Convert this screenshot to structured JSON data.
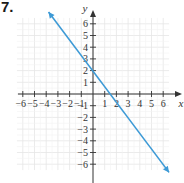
{
  "problem_number": "7.",
  "chart_data": {
    "type": "line",
    "title": "",
    "xlabel": "x",
    "ylabel": "y",
    "xlim": [
      -6,
      6
    ],
    "ylim": [
      -6,
      6
    ],
    "grid": true,
    "x_ticks": [
      -6,
      -5,
      -4,
      -3,
      -2,
      -1,
      1,
      2,
      3,
      4,
      5,
      6
    ],
    "y_ticks": [
      -6,
      -5,
      -4,
      -3,
      -2,
      -1,
      1,
      2,
      3,
      4,
      5,
      6
    ],
    "series": [
      {
        "name": "line",
        "equation": "y = -4/3 x + 2",
        "slope": -1.3333,
        "y_intercept": 2,
        "x_intercept": 1.5,
        "x": [
          -3.8,
          6.5
        ],
        "y": [
          7.0,
          -6.7
        ],
        "arrows_both_ends": true,
        "color": "#3d9ad6"
      }
    ]
  },
  "colors": {
    "grid": "#e6e6e6",
    "axis": "#333333",
    "line": "#3d9ad6"
  }
}
